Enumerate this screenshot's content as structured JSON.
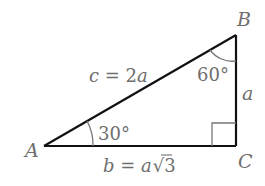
{
  "diagram": {
    "type": "right-triangle",
    "vertices": {
      "A": {
        "label": "A"
      },
      "B": {
        "label": "B"
      },
      "C": {
        "label": "C"
      }
    },
    "angles": {
      "A": "30°",
      "B": "60°"
    },
    "sides": {
      "hypotenuse": {
        "var": "c",
        "eq": " = 2",
        "tail": "a"
      },
      "opposite": {
        "label": "a"
      },
      "adjacent": {
        "var": "b",
        "eq": " = ",
        "tail": "a",
        "radical": "√",
        "radicand": "3"
      }
    },
    "colors": {
      "line": "#111111",
      "label": "#6e6e6e",
      "arc": "#777777"
    }
  }
}
